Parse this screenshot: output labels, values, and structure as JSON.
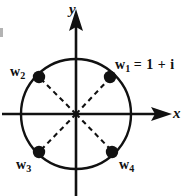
{
  "figure": {
    "background_color": "#ffffff",
    "stroke_color": "#111111",
    "axes": {
      "x_label": "x",
      "y_label": "y"
    },
    "circle": {
      "center": [
        76,
        114
      ],
      "radius": 55
    },
    "points": [
      {
        "id": "w1",
        "label": "w",
        "subscript": "1",
        "equation": "= 1 + i",
        "angle_deg": 45,
        "cx": 110,
        "cy": 77
      },
      {
        "id": "w2",
        "label": "w",
        "subscript": "2",
        "equation": "",
        "angle_deg": 135,
        "cx": 39,
        "cy": 77
      },
      {
        "id": "w3",
        "label": "w",
        "subscript": "3",
        "equation": "",
        "angle_deg": 225,
        "cx": 39,
        "cy": 152
      },
      {
        "id": "w4",
        "label": "w",
        "subscript": "4",
        "equation": "",
        "angle_deg": 315,
        "cx": 112,
        "cy": 152
      }
    ]
  }
}
